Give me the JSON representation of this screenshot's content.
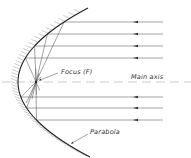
{
  "diagram": {
    "type": "parabolic-reflector",
    "labels": {
      "focus": "Focus (F)",
      "axis": "Main axis",
      "curve": "Parabola"
    },
    "focus": {
      "x": 36,
      "y": 82
    },
    "rays_y": [
      22,
      34,
      46,
      58,
      97,
      108,
      120
    ],
    "colors": {
      "line": "#333333",
      "ray": "#555555",
      "hatch": "#888888",
      "axis": "#999999"
    }
  }
}
